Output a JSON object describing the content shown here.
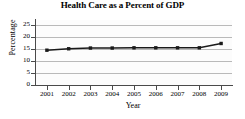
{
  "chart_data": {
    "type": "line",
    "title": "Health Care as a Percent of GDP",
    "xlabel": "Year",
    "ylabel": "Percentage",
    "categories": [
      "2001",
      "2002",
      "2003",
      "2004",
      "2005",
      "2006",
      "2007",
      "2008",
      "2009"
    ],
    "values": [
      14.5,
      15.1,
      15.4,
      15.4,
      15.5,
      15.5,
      15.5,
      15.5,
      17.3
    ],
    "ylim": [
      0,
      25
    ],
    "yticks": [
      "0",
      "5",
      "10",
      "15",
      "20",
      "25"
    ],
    "grid": true,
    "legend": "none",
    "marker": "square",
    "line_color": "#1a1a1a",
    "grid_color": "#b9b9b9",
    "plot_background": "#fcfcfc"
  },
  "axes": {
    "y_ticks": [
      {
        "label": "25",
        "value": 25
      },
      {
        "label": "20",
        "value": 20
      },
      {
        "label": "15",
        "value": 15
      },
      {
        "label": "10",
        "value": 10
      },
      {
        "label": "5",
        "value": 5
      },
      {
        "label": "0",
        "value": 0
      }
    ],
    "x_ticks": [
      {
        "label": "2001"
      },
      {
        "label": "2002"
      },
      {
        "label": "2003"
      },
      {
        "label": "2004"
      },
      {
        "label": "2005"
      },
      {
        "label": "2006"
      },
      {
        "label": "2007"
      },
      {
        "label": "2008"
      },
      {
        "label": "2009"
      }
    ]
  }
}
